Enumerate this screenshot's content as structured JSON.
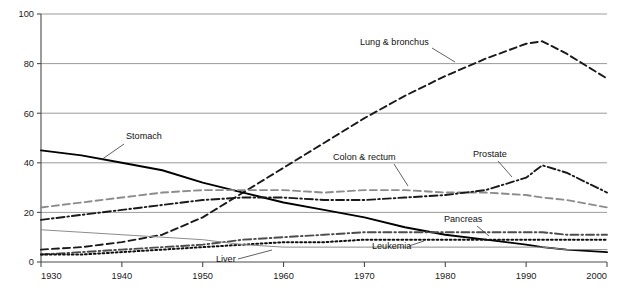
{
  "chart_data": {
    "type": "line",
    "title": "",
    "xlabel": "",
    "ylabel": "Rate per 100,000 male population",
    "xlim": [
      1930,
      2000
    ],
    "ylim": [
      0,
      100
    ],
    "xticks": [
      1930,
      1940,
      1950,
      1960,
      1970,
      1980,
      1990,
      2000
    ],
    "yticks": [
      0,
      20,
      40,
      60,
      80,
      100
    ],
    "grid": "horizontal",
    "legend": "inline-annotations",
    "x": [
      1930,
      1935,
      1940,
      1945,
      1950,
      1955,
      1960,
      1965,
      1970,
      1975,
      1980,
      1985,
      1990,
      1992,
      1995,
      2000
    ],
    "series": [
      {
        "name": "Lung & bronchus",
        "style": "dashed",
        "color": "#1a1a1a",
        "label": "Lung & bronchus",
        "values": [
          5,
          6,
          8,
          11,
          18,
          28,
          38,
          48,
          58,
          67,
          75,
          82,
          88,
          89,
          84,
          74
        ]
      },
      {
        "name": "Stomach",
        "style": "solid",
        "color": "#000000",
        "label": "Stomach",
        "values": [
          45,
          43,
          40,
          37,
          32,
          28,
          24,
          21,
          18,
          14,
          11,
          9,
          7,
          6,
          5,
          4
        ]
      },
      {
        "name": "Colon & rectum",
        "style": "dashed",
        "color": "#8c8c8c",
        "label": "Colon & rectum",
        "values": [
          22,
          24,
          26,
          28,
          29,
          29,
          29,
          28,
          29,
          29,
          28,
          28,
          27,
          26,
          25,
          22
        ]
      },
      {
        "name": "Prostate",
        "style": "dashdot",
        "color": "#1a1a1a",
        "label": "Prostate",
        "values": [
          17,
          19,
          21,
          23,
          25,
          26,
          26,
          25,
          25,
          26,
          27,
          29,
          34,
          39,
          36,
          28
        ]
      },
      {
        "name": "Pancreas",
        "style": "dashdot",
        "color": "#4d4d4d",
        "label": "Pancreas",
        "values": [
          3,
          4,
          5,
          6,
          7,
          9,
          10,
          11,
          12,
          12,
          12,
          12,
          12,
          12,
          11,
          11
        ]
      },
      {
        "name": "Leukemia",
        "style": "dotted",
        "color": "#111111",
        "label": "Leukemia",
        "values": [
          3,
          3,
          4,
          5,
          6,
          7,
          8,
          8,
          9,
          9,
          9,
          9,
          9,
          9,
          9,
          9
        ]
      },
      {
        "name": "Liver",
        "style": "solid-thin",
        "color": "#8c8c8c",
        "label": "Liver",
        "values": [
          13,
          12,
          11,
          10,
          9,
          7,
          6,
          6,
          6,
          6,
          6,
          6,
          6,
          6,
          5,
          5
        ]
      }
    ],
    "annotations": [
      {
        "text": "Lung & bronchus",
        "x": 360,
        "y": 45,
        "leader": [
          [
            432,
            48
          ],
          [
            455,
            62
          ]
        ]
      },
      {
        "text": "Stomach",
        "x": 126,
        "y": 139,
        "leader": [
          [
            124,
            144
          ],
          [
            101,
            160
          ]
        ]
      },
      {
        "text": "Colon & rectum",
        "x": 333,
        "y": 160,
        "leader": [
          [
            394,
            164
          ],
          [
            408,
            186
          ]
        ]
      },
      {
        "text": "Prostate",
        "x": 473,
        "y": 157,
        "leader": [
          [
            498,
            161
          ],
          [
            512,
            177
          ]
        ]
      },
      {
        "text": "Pancreas",
        "x": 444,
        "y": 222,
        "leader": [
          [
            477,
            226
          ],
          [
            489,
            236
          ]
        ]
      },
      {
        "text": "Leukemia",
        "x": 372,
        "y": 249,
        "leader": [
          [
            409,
            246
          ],
          [
            424,
            241
          ]
        ]
      },
      {
        "text": "Liver",
        "x": 216,
        "y": 262,
        "leader": [
          [
            238,
            259
          ],
          [
            272,
            250
          ]
        ]
      }
    ]
  }
}
